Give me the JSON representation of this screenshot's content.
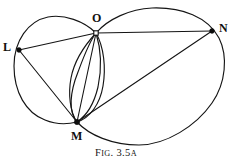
{
  "figure": {
    "caption_prefix": "F",
    "caption_prefix_small": "IG",
    "caption_separator": ". ",
    "caption_number": "3.5",
    "caption_suffix": "A",
    "caption_full": "FIG. 3.5A",
    "background_color": "#ffffff",
    "ink_color": "#141414"
  },
  "points": [
    {
      "id": "L",
      "label": "L",
      "x": 19,
      "y": 50,
      "marker": "dot"
    },
    {
      "id": "O",
      "label": "O",
      "x": 96,
      "y": 33,
      "marker": "ring"
    },
    {
      "id": "N",
      "label": "N",
      "x": 212,
      "y": 31,
      "marker": "dot"
    },
    {
      "id": "M",
      "label": "M",
      "x": 77,
      "y": 122,
      "marker": "dot"
    }
  ],
  "curves": [
    {
      "id": "left-circle",
      "name": "circle-through-L-O-M",
      "type": "closed-curve"
    },
    {
      "id": "right-circle",
      "name": "large-circle-through-O-N-M",
      "type": "closed-curve"
    },
    {
      "id": "lens-arc-left",
      "name": "arc-O-to-M-bulging-left",
      "type": "arc"
    },
    {
      "id": "lens-arc-right",
      "name": "arc-O-to-M-bulging-right",
      "type": "arc"
    }
  ],
  "chords": [
    {
      "id": "LO",
      "name": "segment-L-O",
      "from": "L",
      "to": "O"
    },
    {
      "id": "LM",
      "name": "segment-L-M",
      "from": "L",
      "to": "M"
    },
    {
      "id": "ON",
      "name": "segment-O-N",
      "from": "O",
      "to": "N"
    },
    {
      "id": "OM",
      "name": "segment-O-M",
      "from": "O",
      "to": "M"
    },
    {
      "id": "MN",
      "name": "segment-M-N",
      "from": "M",
      "to": "N"
    }
  ]
}
